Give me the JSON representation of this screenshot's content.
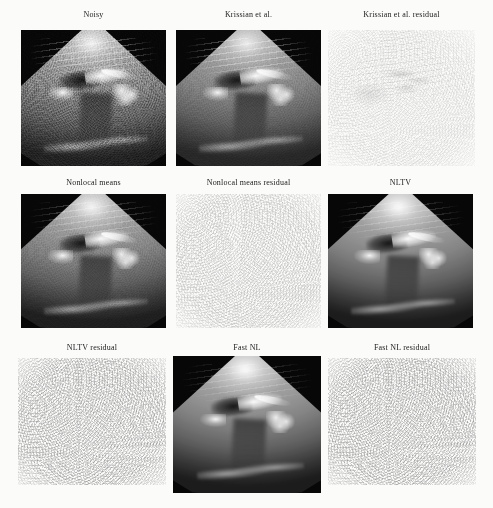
{
  "figure": {
    "background_color": "#fbfbfa",
    "label_color": "#1b1b1b"
  },
  "panels": [
    {
      "id": "noisy",
      "label": "Noisy",
      "kind": "ultrasound",
      "row": 1,
      "col": 1
    },
    {
      "id": "krissian",
      "label": "Krissian et al.",
      "kind": "ultrasound",
      "row": 1,
      "col": 2
    },
    {
      "id": "krissian-residual",
      "label": "Krissian et al. residual",
      "kind": "residual",
      "row": 1,
      "col": 3
    },
    {
      "id": "nonlocal-means",
      "label": "Nonlocal means",
      "kind": "ultrasound",
      "row": 2,
      "col": 1
    },
    {
      "id": "nonlocal-means-residual",
      "label": "Nonlocal means residual",
      "kind": "residual",
      "row": 2,
      "col": 2
    },
    {
      "id": "nltv",
      "label": "NLTV",
      "kind": "ultrasound",
      "row": 2,
      "col": 3
    },
    {
      "id": "nltv-residual",
      "label": "NLTV residual",
      "kind": "residual",
      "row": 3,
      "col": 1
    },
    {
      "id": "fast-nl",
      "label": "Fast NL",
      "kind": "ultrasound",
      "row": 3,
      "col": 2
    },
    {
      "id": "fast-nl-residual",
      "label": "Fast NL residual",
      "kind": "residual",
      "row": 3,
      "col": 3
    }
  ]
}
